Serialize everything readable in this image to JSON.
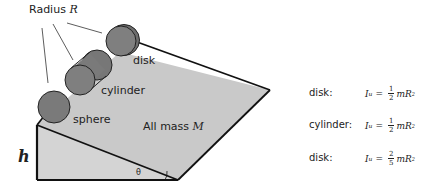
{
  "diagram": {
    "radius_label": "Radius ",
    "radius_symbol": "R",
    "objects": {
      "disk": "disk",
      "cylinder": "cylinder",
      "sphere": "sphere"
    },
    "mass_label": "All mass ",
    "mass_symbol": "M",
    "height_symbol": "h",
    "angle_symbol": "θ",
    "colors": {
      "ramp_fill": "#c8c8c8",
      "object_fill": "#7a7a7a",
      "line": "#111111"
    }
  },
  "formulas": [
    {
      "label": "disk:",
      "I": "I",
      "sub": "u",
      "eq": "=",
      "num": "1",
      "den": "2",
      "rhs": "mR",
      "exp": "2"
    },
    {
      "label": "cylinder:",
      "I": "I",
      "sub": "u",
      "eq": "=",
      "num": "1",
      "den": "2",
      "rhs": "mR",
      "exp": "2"
    },
    {
      "label": "disk:",
      "I": "I",
      "sub": "u",
      "eq": "=",
      "num": "2",
      "den": "5",
      "rhs": "mR",
      "exp": "2"
    }
  ]
}
